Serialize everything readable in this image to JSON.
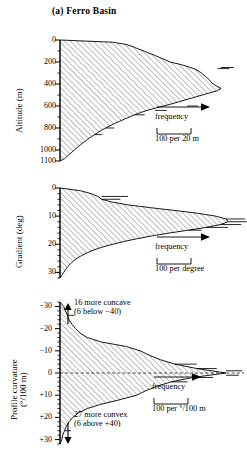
{
  "figure": {
    "title": "(a) Ferro Basin",
    "hatch_angle_deg": 45,
    "line_color": "#000000",
    "hatch_color": "#555555"
  },
  "chart_data": [
    {
      "type": "area",
      "name": "altitude-distribution",
      "title": "",
      "ylabel": "Altitude (m)",
      "xlabel": "frequency",
      "orientation": "horizontal",
      "ylim": [
        0,
        1100
      ],
      "y_inverted": true,
      "yticks": [
        0,
        200,
        400,
        600,
        800,
        1000,
        1100
      ],
      "ytick_labels": [
        "0",
        "200",
        "400",
        "600",
        "800",
        "1000",
        "1100"
      ],
      "minor_tick_interval": 100,
      "grid": false,
      "scale_bar": {
        "label": "100 per 20 m",
        "value": 100,
        "unit": "per 20 m"
      },
      "frequency_arrow_label": "frequency",
      "y": [
        0,
        20,
        40,
        60,
        80,
        100,
        120,
        140,
        160,
        180,
        200,
        220,
        240,
        260,
        280,
        300,
        320,
        340,
        360,
        380,
        400,
        420,
        440,
        460,
        480,
        500,
        520,
        540,
        560,
        580,
        600,
        620,
        640,
        660,
        680,
        700,
        720,
        740,
        760,
        780,
        800,
        820,
        840,
        860,
        880,
        900,
        920,
        940,
        960,
        980,
        1000,
        1020,
        1040,
        1060,
        1080,
        1100
      ],
      "values": [
        0,
        62,
        78,
        86,
        92,
        99,
        105,
        112,
        118,
        124,
        130,
        141,
        150,
        158,
        163,
        167,
        170,
        173,
        176,
        178,
        181,
        185,
        190,
        186,
        177,
        168,
        159,
        150,
        141,
        132,
        122,
        112,
        103,
        95,
        88,
        82,
        76,
        70,
        64,
        59,
        54,
        49,
        45,
        41,
        37,
        33,
        30,
        26,
        23,
        20,
        17,
        14,
        11,
        8,
        5,
        0
      ]
    },
    {
      "type": "area",
      "name": "gradient-distribution",
      "title": "",
      "ylabel": "Gradient (deg)",
      "xlabel": "frequency",
      "orientation": "horizontal",
      "ylim": [
        0,
        32
      ],
      "y_inverted": true,
      "yticks": [
        0,
        10,
        20,
        30
      ],
      "ytick_labels": [
        "0",
        "10",
        "20",
        "30"
      ],
      "minor_tick_interval": 2,
      "grid": false,
      "scale_bar": {
        "label": "100 per degree",
        "value": 100,
        "unit": "per degree"
      },
      "frequency_arrow_label": "frequency",
      "y": [
        0,
        1,
        2,
        3,
        4,
        5,
        6,
        7,
        8,
        9,
        10,
        11,
        12,
        13,
        14,
        15,
        16,
        17,
        18,
        19,
        20,
        21,
        22,
        23,
        24,
        25,
        26,
        27,
        28,
        29,
        30,
        31,
        32
      ],
      "values": [
        0,
        22,
        33,
        40,
        44,
        55,
        72,
        96,
        122,
        146,
        165,
        176,
        178,
        170,
        155,
        136,
        116,
        98,
        82,
        68,
        56,
        45,
        36,
        29,
        23,
        18,
        14,
        11,
        8,
        6,
        4,
        2,
        0
      ]
    },
    {
      "type": "area",
      "name": "profile-curvature-distribution",
      "title": "",
      "ylabel": "Profile curvature (°/100 m)",
      "ylabel_line1": "Profile curvature",
      "ylabel_line2": "(°/100 m)",
      "xlabel": "frequency",
      "orientation": "horizontal",
      "ylim": [
        -32,
        32
      ],
      "y_inverted": true,
      "yticks": [
        -30,
        -20,
        -10,
        0,
        10,
        20,
        30
      ],
      "ytick_labels": [
        "−30",
        "−20",
        "−10",
        "0",
        "+10",
        "+20",
        "+30"
      ],
      "minor_tick_interval": 2,
      "zero_line": true,
      "grid": false,
      "scale_bar": {
        "label": "100 per °/100 m",
        "value": 100,
        "unit": "per °/100 m"
      },
      "frequency_arrow_label": "frequency",
      "y": [
        -32,
        -30,
        -28,
        -26,
        -24,
        -22,
        -20,
        -18,
        -16,
        -14,
        -12,
        -10,
        -8,
        -6,
        -4,
        -2,
        0,
        2,
        4,
        6,
        8,
        10,
        12,
        14,
        16,
        18,
        20,
        22,
        24,
        26,
        28,
        30,
        32
      ],
      "values": [
        0,
        4,
        6,
        8,
        10,
        13,
        17,
        22,
        30,
        45,
        72,
        88,
        98,
        110,
        126,
        150,
        182,
        146,
        122,
        106,
        94,
        84,
        66,
        46,
        30,
        20,
        14,
        10,
        7,
        5,
        3,
        2,
        0
      ],
      "annotations": [
        {
          "name": "concave-note",
          "arrow": "up",
          "line1": "16 more concave",
          "line2": "(6 below −40)",
          "count": 16,
          "beyond_count": 6,
          "threshold": "−40"
        },
        {
          "name": "convex-note",
          "arrow": "down",
          "line1": "27 more convex",
          "line2": "(6 above +40)",
          "count": 27,
          "beyond_count": 6,
          "threshold": "+40"
        }
      ]
    }
  ]
}
